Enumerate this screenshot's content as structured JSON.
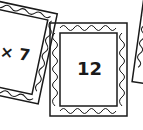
{
  "frames": [
    {
      "id": "left",
      "text": "× 7"
    },
    {
      "id": "center",
      "text": "12"
    },
    {
      "id": "right",
      "text": ""
    }
  ],
  "colors": {
    "stroke": "#1a1a1a",
    "background": "#ffffff"
  }
}
